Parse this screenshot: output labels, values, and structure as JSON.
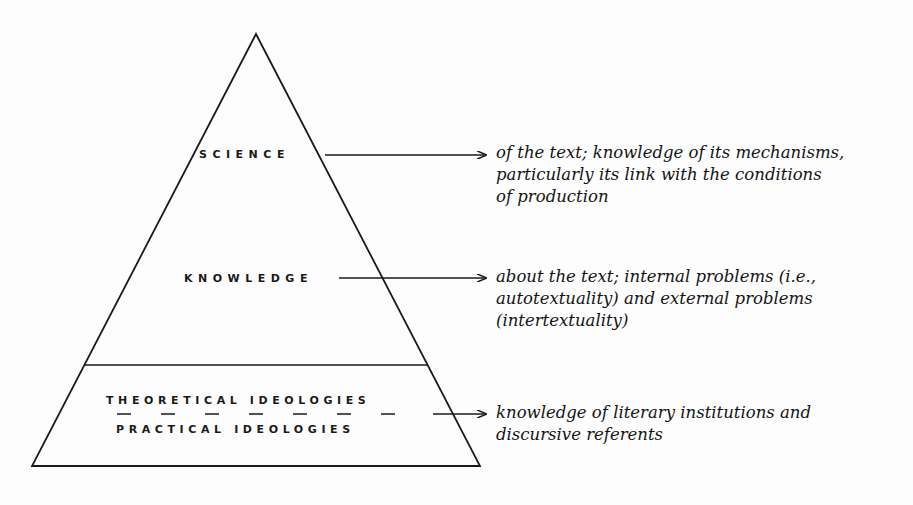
{
  "diagram": {
    "type": "pyramid",
    "tiers": [
      {
        "label": "SCIENCE",
        "description_lines": [
          "of the text; knowledge of its mechanisms,",
          "particularly its link with the conditions",
          "of production"
        ]
      },
      {
        "label": "KNOWLEDGE",
        "description_lines": [
          "about the text; internal problems (i.e.,",
          "autotextuality) and external problems",
          "(intertextuality)"
        ]
      },
      {
        "label_top": "THEORETICAL IDEOLOGIES",
        "label_bottom": "PRACTICAL IDEOLOGIES",
        "description_lines": [
          "knowledge of literary institutions and",
          "discursive referents"
        ]
      }
    ],
    "colors": {
      "ink": "#1a1a1a",
      "background": "#fdfdfd"
    }
  }
}
